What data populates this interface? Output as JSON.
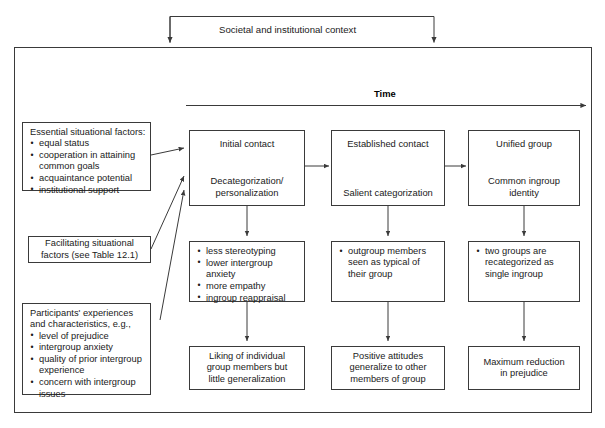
{
  "diagram": {
    "title_context": "Societal and institutional context",
    "time_axis_label": "Time",
    "left_panels": [
      {
        "id": "essential-situational-factors",
        "heading": "Essential situational factors:",
        "items": [
          "equal status",
          "cooperation in attaining common goals",
          "acquaintance potential",
          "institutional support"
        ]
      },
      {
        "id": "facilitating-situational-factors",
        "lines": [
          "Facilitating situational",
          "factors (see Table 12.1)"
        ]
      },
      {
        "id": "participants-experiences",
        "heading_lines": [
          "Participants' experiences",
          "and characteristics, e.g.,"
        ],
        "items": [
          "level of prejudice",
          "intergroup anxiety",
          "quality of prior intergroup experience",
          "concern with intergroup issues"
        ]
      }
    ],
    "columns": [
      {
        "id": "column-1",
        "stage": {
          "top": "Initial contact",
          "bottom_lines": [
            "Decategorization/",
            "personalization"
          ]
        },
        "outcomes": [
          "less stereotyping",
          "lower intergroup anxiety",
          "more empathy",
          "ingroup reappraisal"
        ],
        "result_lines": [
          "Liking of individual",
          "group members but",
          "little generalization"
        ]
      },
      {
        "id": "column-2",
        "stage": {
          "top": "Established contact",
          "bottom_lines": [
            "Salient categorization"
          ]
        },
        "outcomes": [
          "outgroup members seen as typical of their group"
        ],
        "result_lines": [
          "Positive attitudes",
          "generalize to other",
          "members of group"
        ]
      },
      {
        "id": "column-3",
        "stage": {
          "top": "Unified group",
          "bottom_lines": [
            "Common ingroup",
            "identity"
          ]
        },
        "outcomes": [
          "two groups are recategorized as single ingroup"
        ],
        "result_lines": [
          "Maximum reduction",
          "in prejudice"
        ]
      }
    ]
  },
  "colors": {
    "line": "#3a3a3a",
    "text": "#1a1a1a",
    "background": "#ffffff"
  }
}
